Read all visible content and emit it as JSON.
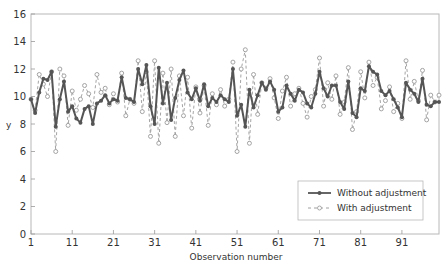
{
  "chart_data": {
    "type": "line",
    "title": "",
    "xlabel": "Observation number",
    "ylabel": "y",
    "xlim": [
      1,
      100
    ],
    "ylim": [
      0,
      16
    ],
    "xticks": [
      1,
      11,
      21,
      31,
      41,
      51,
      61,
      71,
      81,
      91
    ],
    "yticks": [
      0,
      2,
      4,
      6,
      8,
      10,
      12,
      14,
      16
    ],
    "grid": false,
    "legend_position": "lower right",
    "series": [
      {
        "name": "Without adjustment",
        "style": "solid-filled-circle",
        "color": "#555555",
        "values": [
          9.8,
          8.8,
          10.3,
          11.3,
          11.2,
          11.8,
          7.8,
          9.8,
          11.1,
          8.9,
          9.3,
          8.4,
          8.1,
          9.1,
          9.3,
          8.0,
          9.5,
          9.7,
          10.1,
          9.5,
          9.8,
          9.7,
          11.4,
          9.9,
          9.8,
          9.6,
          12.0,
          10.9,
          12.3,
          9.3,
          8.0,
          12.1,
          9.5,
          11.0,
          8.3,
          9.9,
          11.2,
          11.9,
          10.3,
          9.8,
          10.6,
          9.7,
          10.9,
          9.3,
          9.9,
          9.6,
          10.1,
          9.8,
          9.6,
          12.0,
          8.6,
          9.4,
          7.8,
          10.5,
          9.2,
          10.1,
          11.0,
          10.5,
          11.1,
          10.5,
          8.9,
          9.2,
          10.8,
          10.2,
          9.7,
          10.5,
          10.3,
          9.5,
          9.2,
          10.2,
          11.8,
          10.6,
          10.0,
          10.8,
          10.8,
          9.6,
          9.1,
          11.1,
          8.8,
          8.5,
          10.6,
          10.4,
          12.2,
          11.8,
          11.6,
          10.4,
          10.1,
          10.4,
          9.8,
          9.2,
          8.5,
          11.0,
          10.5,
          10.2,
          9.6,
          11.3,
          9.4,
          9.3,
          9.6,
          9.6
        ]
      },
      {
        "name": "With adjustment",
        "style": "dashed-open-circle",
        "color": "#9a9a9a",
        "values": [
          9.8,
          9.0,
          11.6,
          10.9,
          10.0,
          11.8,
          6.0,
          12.0,
          11.5,
          7.9,
          10.4,
          9.0,
          9.8,
          10.8,
          10.2,
          9.2,
          11.6,
          10.3,
          10.6,
          9.4,
          10.2,
          9.6,
          11.7,
          8.6,
          9.8,
          9.5,
          12.6,
          8.9,
          11.8,
          7.1,
          12.6,
          6.6,
          11.7,
          8.1,
          12.0,
          7.1,
          11.5,
          8.6,
          11.4,
          7.7,
          10.7,
          8.8,
          10.8,
          7.9,
          10.2,
          9.4,
          10.5,
          9.3,
          9.8,
          12.5,
          6.0,
          12.0,
          13.4,
          6.6,
          11.6,
          8.7,
          11.0,
          10.6,
          11.3,
          9.9,
          8.4,
          10.4,
          11.4,
          9.3,
          10.2,
          10.6,
          9.5,
          8.5,
          10.0,
          10.5,
          12.8,
          9.3,
          11.0,
          9.8,
          11.5,
          8.7,
          9.6,
          12.1,
          7.6,
          8.9,
          11.8,
          9.9,
          12.5,
          10.8,
          11.4,
          9.1,
          9.7,
          10.7,
          8.9,
          9.5,
          8.4,
          12.6,
          9.8,
          11.1,
          9.7,
          11.9,
          8.3,
          10.1,
          9.6,
          10.1
        ]
      }
    ]
  },
  "legend": {
    "items": [
      {
        "label": "Without adjustment"
      },
      {
        "label": "With adjustment"
      }
    ]
  }
}
